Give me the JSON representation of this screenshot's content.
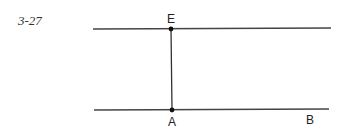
{
  "figure": {
    "label": "3-27"
  },
  "diagram": {
    "line_color": "#444444",
    "point_color": "#111111",
    "lines": [
      {
        "name": "top-line",
        "x1": 93,
        "y1": 29,
        "x2": 331,
        "y2": 28
      },
      {
        "name": "bottom-line",
        "x1": 94,
        "y1": 110,
        "x2": 329,
        "y2": 109
      },
      {
        "name": "segment-EA",
        "x1": 171,
        "y1": 29,
        "x2": 172,
        "y2": 110
      }
    ],
    "points": [
      {
        "name": "E",
        "x": 171,
        "y": 29,
        "label": "E",
        "lx": 171,
        "ly": 23
      },
      {
        "name": "A",
        "x": 172,
        "y": 110,
        "label": "A",
        "lx": 172,
        "ly": 126
      },
      {
        "name": "B",
        "label": "B",
        "lx": 310,
        "ly": 124
      }
    ]
  }
}
